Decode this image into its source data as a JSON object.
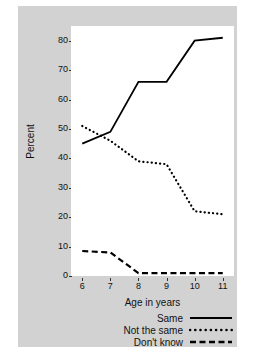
{
  "chart_data": {
    "type": "line",
    "title": "",
    "xlabel": "Age in years",
    "ylabel": "Percent",
    "x": [
      6,
      7,
      8,
      9,
      10,
      11
    ],
    "xlim": [
      5.6,
      11.4
    ],
    "ylim": [
      0,
      85
    ],
    "yticks": [
      0,
      10,
      20,
      30,
      40,
      50,
      60,
      70,
      80
    ],
    "xticks": [
      6,
      7,
      8,
      9,
      10,
      11
    ],
    "grid": false,
    "legend_position": "bottom-right",
    "series": [
      {
        "name": "Same",
        "style": "solid",
        "color": "#000000",
        "values": [
          45,
          49,
          66,
          66,
          80,
          81
        ]
      },
      {
        "name": "Not the same",
        "style": "dotted",
        "color": "#000000",
        "values": [
          51,
          46,
          39,
          38,
          22,
          21
        ]
      },
      {
        "name": "Don't know",
        "style": "dashed",
        "color": "#000000",
        "values": [
          8.5,
          8,
          1,
          1,
          1,
          1
        ]
      }
    ]
  },
  "figure": {
    "panel_color": "#d2d2d2",
    "plot_background": "#ffffff",
    "page_background": "#ffffff"
  },
  "legend": {
    "items": [
      {
        "label": "Same",
        "style": "solid"
      },
      {
        "label": "Not the same",
        "style": "dotted"
      },
      {
        "label": "Don't know",
        "style": "dashed"
      }
    ]
  },
  "ytick_labels": [
    "80",
    "70",
    "60",
    "50",
    "40",
    "30",
    "20",
    "10",
    "0"
  ],
  "xtick_labels": [
    "6",
    "7",
    "8",
    "9",
    "10",
    "11"
  ]
}
